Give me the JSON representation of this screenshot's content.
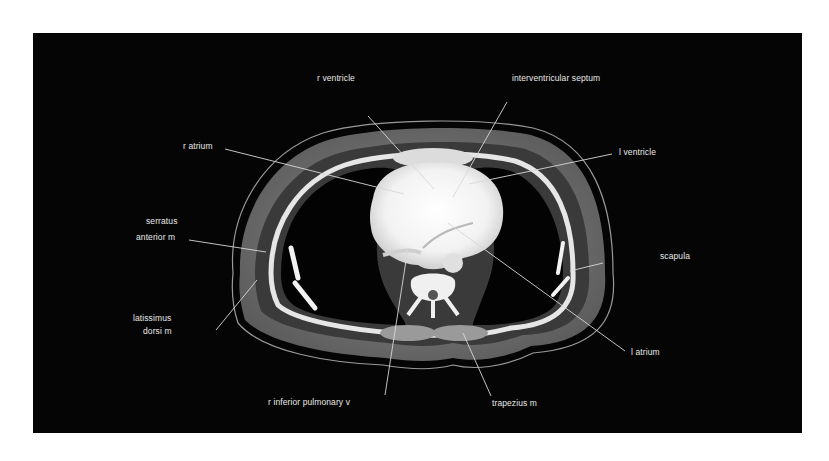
{
  "figure": {
    "type": "axial CT scan of thorax",
    "background_color": "#050505",
    "label_color": "#e8e8e8"
  },
  "labels": [
    {
      "id": "r-ventricle",
      "text": "r ventricle"
    },
    {
      "id": "interventricular-septum",
      "text": "interventricular septum"
    },
    {
      "id": "r-atrium",
      "text": "r atrium"
    },
    {
      "id": "l-ventricle",
      "text": "l ventricle"
    },
    {
      "id": "serratus-anterior-line1",
      "text": "serratus"
    },
    {
      "id": "serratus-anterior-line2",
      "text": "anterior m"
    },
    {
      "id": "scapula",
      "text": "scapula"
    },
    {
      "id": "latissimus-dorsi-line1",
      "text": "latissimus"
    },
    {
      "id": "latissimus-dorsi-line2",
      "text": "dorsi m"
    },
    {
      "id": "l-atrium",
      "text": "l atrium"
    },
    {
      "id": "r-inferior-pulmonary-v",
      "text": "r inferior pulmonary v"
    },
    {
      "id": "trapezius-m",
      "text": "trapezius m"
    }
  ]
}
